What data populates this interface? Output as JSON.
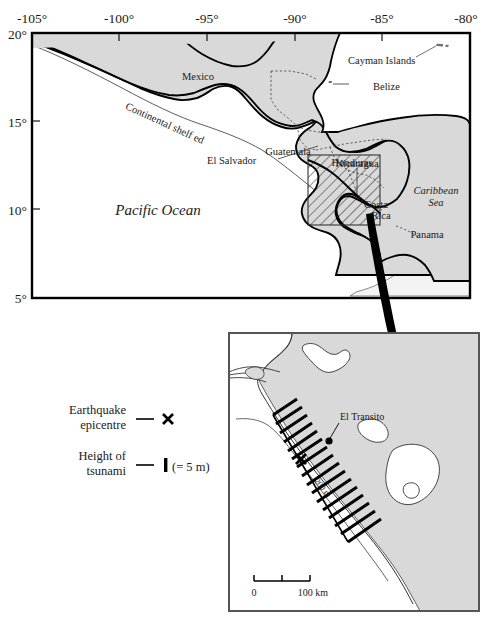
{
  "figure": {
    "type": "map",
    "title": "",
    "background_color": "#ffffff",
    "land_color": "#d9d9d9",
    "ocean_color": "#ffffff",
    "shelf_color": "#f2f2f2",
    "line_color": "#000000",
    "border_color": "#808080"
  },
  "main_map": {
    "name": "central-america-regional-map",
    "x_axis": {
      "label": "",
      "ticks": [
        "-105°",
        "-100°",
        "-95°",
        "-90°",
        "-85°",
        "-80°"
      ],
      "values": [
        -105,
        -100,
        -95,
        -90,
        -85,
        -80
      ],
      "range": [
        -105,
        -80
      ],
      "position": "top"
    },
    "y_axis": {
      "label": "",
      "ticks": [
        "20°",
        "15°",
        "10°",
        "5°"
      ],
      "values": [
        20,
        15,
        10,
        5
      ],
      "range": [
        5,
        20
      ],
      "position": "left"
    },
    "labels": [
      {
        "text": "Mexico",
        "style": "country"
      },
      {
        "text": "Guatemala",
        "style": "country"
      },
      {
        "text": "Honduras",
        "style": "country"
      },
      {
        "text": "Belize",
        "style": "country"
      },
      {
        "text": "Cayman Islands",
        "style": "country"
      },
      {
        "text": "El Salvador",
        "style": "country"
      },
      {
        "text": "Nicaragua",
        "style": "country"
      },
      {
        "text": "Costa",
        "style": "country"
      },
      {
        "text": "Rica",
        "style": "country"
      },
      {
        "text": "Panama",
        "style": "country"
      },
      {
        "text": "Pacific Ocean",
        "style": "ocean"
      },
      {
        "text": "Caribbean",
        "style": "sea"
      },
      {
        "text": "Sea",
        "style": "sea"
      },
      {
        "text": "Continental  shelf  edge",
        "style": "annotation"
      }
    ],
    "text": {
      "mexico": "Mexico",
      "guatemala": "Guatemala",
      "honduras": "Honduras",
      "belize": "Belize",
      "cayman_islands": "Cayman Islands",
      "el_salvador": "El Salvador",
      "nicaragua": "Nicaragua",
      "costa": "Costa",
      "rica": "Rica",
      "panama": "Panama",
      "pacific_ocean": "Pacific Ocean",
      "caribbean": "Caribbean",
      "sea": "Sea",
      "shelf_edge": "Continental  shelf  edge"
    },
    "inset_box": {
      "name": "inset-location-box",
      "fill": "hatched",
      "description": "hatched rectangle marking the detail area"
    }
  },
  "legend": {
    "name": "map-legend",
    "items": [
      {
        "label_line1": "Earthquake",
        "label_line2": "epicentre",
        "symbol": "cross-marker",
        "suffix": ""
      },
      {
        "label_line1": "Height of",
        "label_line2": "tsunami",
        "symbol": "bar-marker",
        "suffix": "(= 5 m)"
      }
    ]
  },
  "inset_map": {
    "name": "nicaragua-coast-detail-map",
    "labels": {
      "el_transito": "El Transito",
      "contour": "200 m"
    },
    "scale_bar": {
      "start_label": "0",
      "end_label": "100 km",
      "segments": 2,
      "total_km": 100
    },
    "epicentre_marker": "cross-marker",
    "tsunami_bars_count": 16
  }
}
